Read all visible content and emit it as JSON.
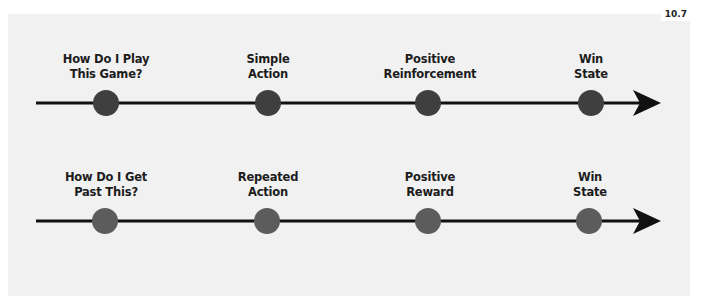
{
  "figure_number": "10.7",
  "colors": {
    "background": "#f1f1f1",
    "line": "#111111",
    "top_node": "#3f3f3f",
    "bottom_node": "#5c5c5c",
    "label": "#1c1c1c"
  },
  "timelines": [
    {
      "nodes": [
        {
          "line1": "How Do I Play",
          "line2": "This Game?"
        },
        {
          "line1": "Simple",
          "line2": "Action"
        },
        {
          "line1": "Positive",
          "line2": "Reinforcement"
        },
        {
          "line1": "Win",
          "line2": "State"
        }
      ]
    },
    {
      "nodes": [
        {
          "line1": "How Do I Get",
          "line2": "Past This?"
        },
        {
          "line1": "Repeated",
          "line2": "Action"
        },
        {
          "line1": "Positive",
          "line2": "Reward"
        },
        {
          "line1": "Win",
          "line2": "State"
        }
      ]
    }
  ]
}
